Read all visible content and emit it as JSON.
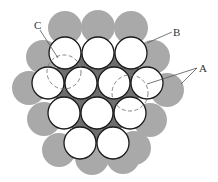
{
  "figure": {
    "colors": {
      "background": "#ffffff",
      "outer_circle_fill": "#a9a9a9",
      "inner_circle_fill": "#ffffff",
      "inner_circle_stroke": "#1a1a1a",
      "interstice_fill": "#6e6e6e",
      "dashed_stroke": "#777777",
      "leader_stroke": "#555555"
    },
    "inner_radius": 16,
    "outer_radius": 17,
    "inner_circles": [
      {
        "cx": 65,
        "cy": 53
      },
      {
        "cx": 98,
        "cy": 53
      },
      {
        "cx": 131,
        "cy": 53
      },
      {
        "cx": 48,
        "cy": 83
      },
      {
        "cx": 81,
        "cy": 83
      },
      {
        "cx": 114,
        "cy": 83
      },
      {
        "cx": 147,
        "cy": 83
      },
      {
        "cx": 64,
        "cy": 113
      },
      {
        "cx": 97,
        "cy": 113
      },
      {
        "cx": 130,
        "cy": 113
      },
      {
        "cx": 80,
        "cy": 143
      },
      {
        "cx": 113,
        "cy": 143
      }
    ],
    "outer_circles": [
      {
        "cx": 65,
        "cy": 28
      },
      {
        "cx": 98,
        "cy": 27
      },
      {
        "cx": 131,
        "cy": 28
      },
      {
        "cx": 43,
        "cy": 57
      },
      {
        "cx": 153,
        "cy": 57
      },
      {
        "cx": 29,
        "cy": 88
      },
      {
        "cx": 167,
        "cy": 90
      },
      {
        "cx": 44,
        "cy": 119
      },
      {
        "cx": 150,
        "cy": 120
      },
      {
        "cx": 59,
        "cy": 150
      },
      {
        "cx": 134,
        "cy": 148
      },
      {
        "cx": 92,
        "cy": 158
      },
      {
        "cx": 123,
        "cy": 157
      }
    ],
    "dashed_circles": [
      {
        "id": "C",
        "cx": 64,
        "cy": 72,
        "r": 17
      },
      {
        "id": "A",
        "cx": 130,
        "cy": 93,
        "r": 18
      }
    ],
    "labels": [
      {
        "id": "C",
        "text": "C",
        "x": 34,
        "y": 20
      },
      {
        "id": "B",
        "text": "B",
        "x": 173,
        "y": 27
      },
      {
        "id": "A",
        "text": "A",
        "x": 199,
        "y": 63
      }
    ],
    "leaders": [
      {
        "for": "C",
        "x1": 40,
        "y1": 30,
        "x2": 58,
        "y2": 58
      },
      {
        "for": "B",
        "x1": 172,
        "y1": 32,
        "x2": 147,
        "y2": 43
      },
      {
        "for": "A",
        "x1": 197,
        "y1": 68,
        "x2": 147,
        "y2": 84
      },
      {
        "for": "A",
        "x1": 197,
        "y1": 68,
        "x2": 181,
        "y2": 84
      }
    ]
  }
}
